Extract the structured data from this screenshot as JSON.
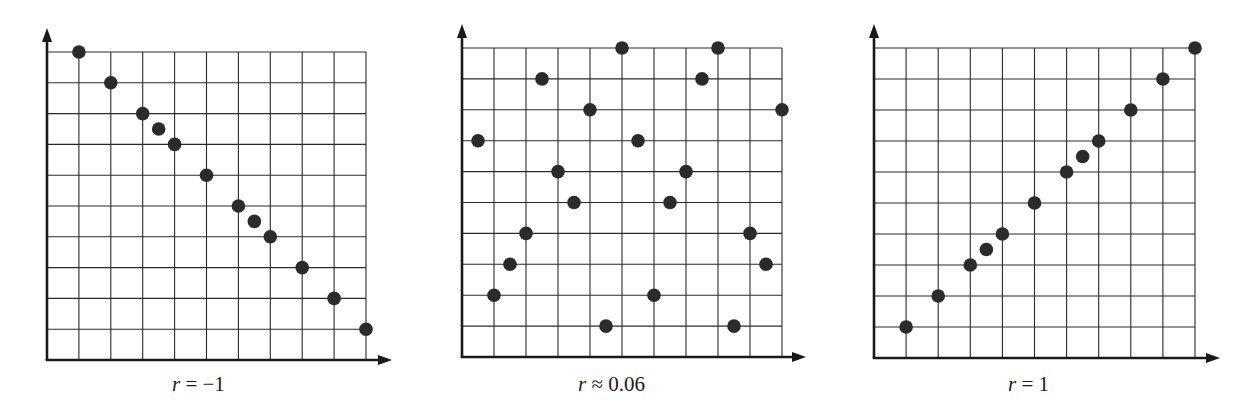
{
  "figure": {
    "ink_color": "#1a1a1a",
    "grid_color": "#2a2a2a",
    "point_color": "#2b2b2b",
    "background": "#ffffff"
  },
  "chart_data": [
    {
      "type": "scatter",
      "title": "",
      "caption_var": "r",
      "caption_rest": " = −1",
      "caption": "r = −1",
      "xlabel": "",
      "ylabel": "",
      "grid": true,
      "xlim": [
        0,
        10
      ],
      "ylim": [
        0,
        10
      ],
      "points": [
        [
          1,
          10
        ],
        [
          2,
          9
        ],
        [
          3,
          8
        ],
        [
          3.5,
          7.5
        ],
        [
          4,
          7
        ],
        [
          5,
          6
        ],
        [
          6,
          5
        ],
        [
          6.5,
          4.5
        ],
        [
          7,
          4
        ],
        [
          8,
          3
        ],
        [
          9,
          2
        ],
        [
          10,
          1
        ]
      ]
    },
    {
      "type": "scatter",
      "title": "",
      "caption_var": "r",
      "caption_rest": " ≈ 0.06",
      "caption": "r ≈ 0.06",
      "xlabel": "",
      "ylabel": "",
      "grid": true,
      "xlim": [
        0,
        10
      ],
      "ylim": [
        0,
        10
      ],
      "points": [
        [
          0.5,
          7
        ],
        [
          1,
          2
        ],
        [
          1.5,
          3
        ],
        [
          2,
          4
        ],
        [
          2.5,
          9
        ],
        [
          3,
          6
        ],
        [
          3.5,
          5
        ],
        [
          4,
          8
        ],
        [
          4.5,
          1
        ],
        [
          5,
          10
        ],
        [
          5.5,
          7
        ],
        [
          6,
          2
        ],
        [
          6.5,
          5
        ],
        [
          7,
          6
        ],
        [
          7.5,
          9
        ],
        [
          8,
          10
        ],
        [
          8.5,
          1
        ],
        [
          9,
          4
        ],
        [
          9.5,
          3
        ],
        [
          10,
          8
        ]
      ]
    },
    {
      "type": "scatter",
      "title": "",
      "caption_var": "r",
      "caption_rest": " = 1",
      "caption": "r = 1",
      "xlabel": "",
      "ylabel": "",
      "grid": true,
      "xlim": [
        0,
        10
      ],
      "ylim": [
        0,
        10
      ],
      "points": [
        [
          1,
          1
        ],
        [
          2,
          2
        ],
        [
          3,
          3
        ],
        [
          3.5,
          3.5
        ],
        [
          4,
          4
        ],
        [
          5,
          5
        ],
        [
          6,
          6
        ],
        [
          6.5,
          6.5
        ],
        [
          7,
          7
        ],
        [
          8,
          8
        ],
        [
          9,
          9
        ],
        [
          10,
          10
        ]
      ]
    }
  ]
}
